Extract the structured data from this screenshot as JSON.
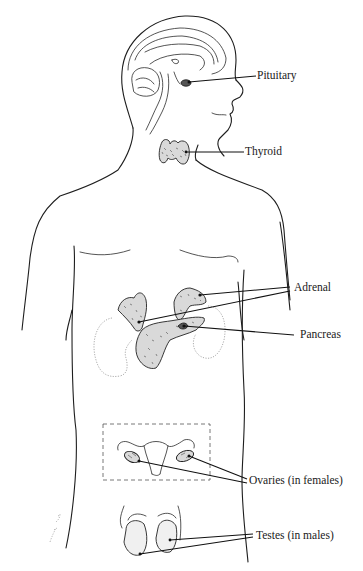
{
  "figure": {
    "labels": {
      "pituitary": "Pituitary",
      "thyroid": "Thyroid",
      "adrenal": "Adrenal",
      "pancreas": "Pancreas",
      "ovaries": "Ovaries (in females)",
      "testes": "Testes (in males)"
    },
    "signature": "artist signature",
    "colors": {
      "line": "#1e1e1e",
      "background": "#ffffff",
      "gland_fill": "#d9d9d9"
    }
  }
}
